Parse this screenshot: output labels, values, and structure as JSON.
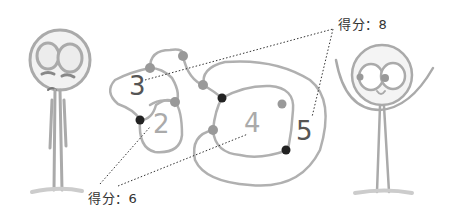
{
  "illustration": {
    "scores": {
      "left": "得分：6",
      "right": "得分：8"
    },
    "region_numbers": {
      "two": "2",
      "three": "3",
      "four": "4",
      "five": "5"
    },
    "colors": {
      "line": "#aaaaaa",
      "node_light": "#999999",
      "node_dark": "#222222",
      "text_dark": "#555555",
      "text_light": "#aaaaaa"
    }
  }
}
